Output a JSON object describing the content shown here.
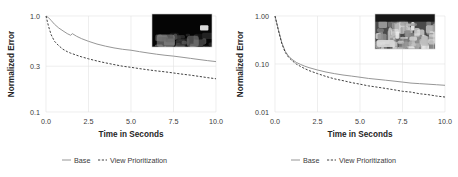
{
  "figure": {
    "panel_count": 2,
    "background_color": "#ffffff",
    "grid_color": "#e2e2e2"
  },
  "chart_data": [
    {
      "type": "line",
      "panel": "left",
      "title": "",
      "xlabel": "Time in Seconds",
      "ylabel": "Normalized Error",
      "xlim": [
        0.0,
        10.0
      ],
      "ylim": [
        0.1,
        1.0
      ],
      "yscale": "log",
      "xscale": "linear",
      "grid": true,
      "legend_position": "bottom",
      "xticks": [
        "0.0",
        "2.5",
        "5.0",
        "7.5",
        "10.0"
      ],
      "xtick_values": [
        0.0,
        2.5,
        5.0,
        7.5,
        10.0
      ],
      "yticks": [
        "1.0",
        "0.3",
        "0.1"
      ],
      "ytick_values": [
        1.0,
        0.3,
        0.1
      ],
      "x": [
        0.0,
        0.15,
        0.3,
        0.5,
        0.75,
        1.0,
        1.25,
        1.45,
        1.55,
        1.8,
        2.1,
        2.5,
        3.0,
        3.5,
        4.0,
        4.5,
        5.0,
        5.5,
        6.0,
        6.5,
        7.0,
        7.5,
        8.0,
        8.5,
        9.0,
        9.5,
        10.0
      ],
      "series": [
        {
          "name": "Base",
          "style": "solid",
          "color": "#8a8a8a",
          "values": [
            1.0,
            0.96,
            0.9,
            0.82,
            0.75,
            0.7,
            0.655,
            0.63,
            0.655,
            0.615,
            0.58,
            0.545,
            0.51,
            0.485,
            0.465,
            0.45,
            0.44,
            0.425,
            0.412,
            0.4,
            0.39,
            0.382,
            0.372,
            0.362,
            0.352,
            0.343,
            0.335
          ]
        },
        {
          "name": "View Prioritization",
          "style": "dashed",
          "color": "#2b2b2b",
          "values": [
            1.0,
            0.78,
            0.64,
            0.545,
            0.49,
            0.45,
            0.425,
            0.41,
            0.405,
            0.39,
            0.375,
            0.358,
            0.34,
            0.325,
            0.312,
            0.3,
            0.292,
            0.283,
            0.275,
            0.268,
            0.262,
            0.255,
            0.248,
            0.242,
            0.235,
            0.228,
            0.222
          ]
        }
      ],
      "inset": {
        "description": "dark low-light grayscale scene",
        "brightness": "dark",
        "x_px": 152,
        "y_px": 14,
        "width_px": 60,
        "height_px": 33
      }
    },
    {
      "type": "line",
      "panel": "right",
      "title": "",
      "xlabel": "Time in Seconds",
      "ylabel": "Normalized Error",
      "xlim": [
        0.0,
        10.0
      ],
      "ylim": [
        0.01,
        1.0
      ],
      "yscale": "log",
      "xscale": "linear",
      "grid": true,
      "legend_position": "bottom",
      "xticks": [
        "0.0",
        "2.5",
        "5.0",
        "7.5",
        "10.0"
      ],
      "xtick_values": [
        0.0,
        2.5,
        5.0,
        7.5,
        10.0
      ],
      "yticks": [
        "1.00",
        "0.10",
        "0.01"
      ],
      "ytick_values": [
        1.0,
        0.1,
        0.01
      ],
      "x": [
        0.0,
        0.2,
        0.4,
        0.6,
        0.8,
        1.0,
        1.25,
        1.5,
        1.75,
        2.0,
        2.5,
        3.0,
        3.5,
        4.0,
        4.5,
        5.0,
        5.5,
        6.0,
        6.5,
        7.0,
        7.5,
        8.0,
        8.5,
        9.0,
        9.5,
        10.0
      ],
      "series": [
        {
          "name": "Base",
          "style": "solid",
          "color": "#8a8a8a",
          "values": [
            1.0,
            0.52,
            0.28,
            0.185,
            0.145,
            0.125,
            0.108,
            0.098,
            0.09,
            0.084,
            0.075,
            0.068,
            0.063,
            0.059,
            0.056,
            0.053,
            0.05,
            0.048,
            0.046,
            0.044,
            0.042,
            0.04,
            0.039,
            0.038,
            0.037,
            0.036
          ]
        },
        {
          "name": "View Prioritization",
          "style": "dashed",
          "color": "#2b2b2b",
          "values": [
            1.0,
            0.5,
            0.265,
            0.175,
            0.138,
            0.118,
            0.1,
            0.089,
            0.08,
            0.073,
            0.063,
            0.055,
            0.049,
            0.045,
            0.041,
            0.038,
            0.035,
            0.033,
            0.031,
            0.029,
            0.027,
            0.026,
            0.024,
            0.023,
            0.0215,
            0.0205
          ]
        }
      ],
      "inset": {
        "description": "bright grayscale cluttered scene",
        "brightness": "bright",
        "x_px": 375,
        "y_px": 14,
        "width_px": 60,
        "height_px": 35
      }
    }
  ],
  "legend": {
    "entries": [
      {
        "label": "Base",
        "style": "solid",
        "color": "#8a8a8a"
      },
      {
        "label": "View Prioritization",
        "style": "dashed",
        "color": "#2b2b2b"
      }
    ]
  }
}
